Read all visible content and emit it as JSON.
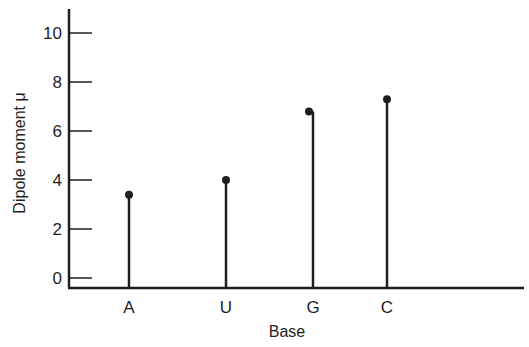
{
  "chart_data": {
    "type": "stem",
    "title": "",
    "xlabel": "Base",
    "ylabel": "Dipole moment μ",
    "categories": [
      "A",
      "U",
      "G",
      "C"
    ],
    "values": [
      3.4,
      4.0,
      6.8,
      7.3
    ],
    "ylim": [
      0,
      11
    ],
    "yticks": [
      0,
      2,
      4,
      6,
      8,
      10
    ],
    "grid": false,
    "legend": null
  },
  "colors": {
    "ink": "#1e1e1e",
    "background": "#ffffff"
  }
}
